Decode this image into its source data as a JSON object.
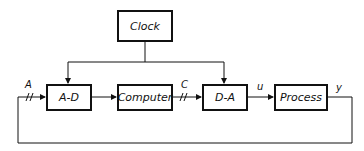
{
  "diagram": {
    "blocks": {
      "clock": "Clock",
      "ad": "A-D",
      "computer": "Computer",
      "da": "D-A",
      "process": "Process"
    },
    "signals": {
      "a": "A",
      "c": "C",
      "u": "u",
      "y": "y"
    },
    "sampling_marks": "//"
  }
}
